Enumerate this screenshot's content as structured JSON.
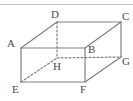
{
  "figure": {
    "kind": "cuboid-oblique-projection",
    "stroke_color": "#808080",
    "hidden_stroke_color": "#808080",
    "label_color": "#4a4a4a",
    "background_color": "#ffffff",
    "rule_color": "#c9c9c9",
    "stroke_width": 1.2,
    "hidden_dash_pattern": "2,2",
    "top_rule": {
      "name": "top-divider-rule",
      "x1": 0,
      "y1": 4.5,
      "x2": 133,
      "y2": 4.5
    },
    "vertices": [
      {
        "id": "A",
        "label": "A",
        "x": 21,
        "y": 48,
        "label_x": 7,
        "label_y": 38,
        "hidden": false
      },
      {
        "id": "B",
        "label": "B",
        "x": 85,
        "y": 48,
        "label_x": 88,
        "label_y": 44,
        "hidden": false
      },
      {
        "id": "C",
        "label": "C",
        "x": 121,
        "y": 22,
        "label_x": 122,
        "label_y": 11,
        "hidden": false
      },
      {
        "id": "D",
        "label": "D",
        "x": 57,
        "y": 22,
        "label_x": 51,
        "label_y": 9,
        "hidden": false
      },
      {
        "id": "E",
        "label": "E",
        "x": 21,
        "y": 82,
        "label_x": 12,
        "label_y": 84,
        "hidden": false
      },
      {
        "id": "F",
        "label": "F",
        "x": 85,
        "y": 82,
        "label_x": 80,
        "label_y": 84,
        "hidden": false
      },
      {
        "id": "G",
        "label": "G",
        "x": 121,
        "y": 57,
        "label_x": 122,
        "label_y": 56,
        "hidden": false
      },
      {
        "id": "H",
        "label": "H",
        "x": 57,
        "y": 58,
        "label_x": 53,
        "label_y": 61,
        "hidden": true
      }
    ],
    "edges": [
      {
        "name": "edge-A-B",
        "from": "A",
        "to": "B",
        "style": "solid"
      },
      {
        "name": "edge-A-D",
        "from": "A",
        "to": "D",
        "style": "solid"
      },
      {
        "name": "edge-A-E",
        "from": "A",
        "to": "E",
        "style": "solid"
      },
      {
        "name": "edge-D-C",
        "from": "D",
        "to": "C",
        "style": "solid"
      },
      {
        "name": "edge-C-G",
        "from": "C",
        "to": "G",
        "style": "solid"
      },
      {
        "name": "edge-C-B",
        "from": "C",
        "to": "B",
        "style": "solid"
      },
      {
        "name": "edge-B-F",
        "from": "B",
        "to": "F",
        "style": "solid"
      },
      {
        "name": "edge-E-F",
        "from": "E",
        "to": "F",
        "style": "solid"
      },
      {
        "name": "edge-F-G",
        "from": "F",
        "to": "G",
        "style": "solid"
      },
      {
        "name": "edge-D-H",
        "from": "D",
        "to": "H",
        "style": "dashed"
      },
      {
        "name": "edge-H-G",
        "from": "H",
        "to": "G",
        "style": "dashed"
      },
      {
        "name": "edge-E-H",
        "from": "E",
        "to": "H",
        "style": "dashed"
      }
    ]
  }
}
